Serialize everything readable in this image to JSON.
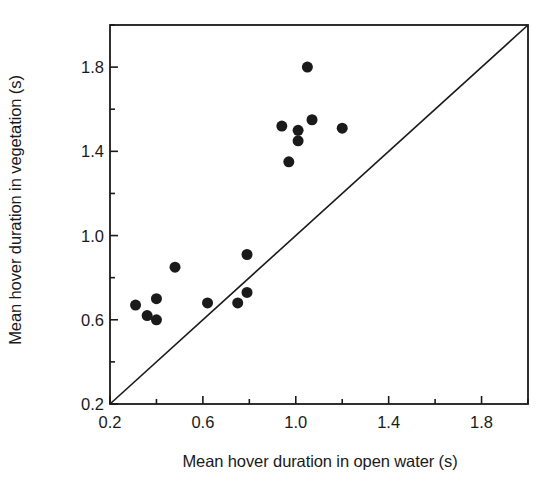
{
  "chart_data": {
    "type": "scatter",
    "title": "",
    "xlabel": "Mean hover duration in open water (s)",
    "ylabel": "Mean hover duration in vegetation (s)",
    "xlim": [
      0.2,
      2.0
    ],
    "ylim": [
      0.2,
      2.0
    ],
    "xticks": [
      0.2,
      0.6,
      1.0,
      1.4,
      1.8
    ],
    "yticks": [
      0.2,
      0.6,
      1.0,
      1.4,
      1.8
    ],
    "xtick_labels": [
      "0.2",
      "0.6",
      "1.0",
      "1.4",
      "1.8"
    ],
    "ytick_labels": [
      "0.2",
      "0.6",
      "1.0",
      "1.4",
      "1.8"
    ],
    "minor_tick_interval": 0.2,
    "grid": false,
    "legend": null,
    "marker": {
      "shape": "circle",
      "color": "#1a1a1a",
      "size_px": 11
    },
    "reference_line": {
      "label": "y = x equality line",
      "from": [
        0.2,
        0.2
      ],
      "to": [
        2.0,
        2.0
      ],
      "color": "#1a1a1a",
      "width_px": 1.6
    },
    "series": [
      {
        "name": "Hover duration pairs",
        "points": [
          {
            "x": 0.31,
            "y": 0.67
          },
          {
            "x": 0.36,
            "y": 0.62
          },
          {
            "x": 0.4,
            "y": 0.6
          },
          {
            "x": 0.4,
            "y": 0.7
          },
          {
            "x": 0.48,
            "y": 0.85
          },
          {
            "x": 0.62,
            "y": 0.68
          },
          {
            "x": 0.75,
            "y": 0.68
          },
          {
            "x": 0.79,
            "y": 0.73
          },
          {
            "x": 0.79,
            "y": 0.91
          },
          {
            "x": 0.94,
            "y": 1.52
          },
          {
            "x": 0.97,
            "y": 1.35
          },
          {
            "x": 1.01,
            "y": 1.5
          },
          {
            "x": 1.01,
            "y": 1.45
          },
          {
            "x": 1.05,
            "y": 1.8
          },
          {
            "x": 1.07,
            "y": 1.55
          },
          {
            "x": 1.2,
            "y": 1.51
          }
        ]
      }
    ]
  },
  "axes_geometry": {
    "left_px": 110,
    "right_px": 528,
    "top_px": 25,
    "bottom_px": 404,
    "frame_color": "#1a1a1a",
    "frame_width_px": 1.8,
    "major_tick_len_px": 8,
    "minor_tick_len_px": 5
  }
}
